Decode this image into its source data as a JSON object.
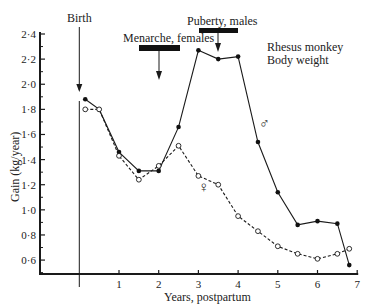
{
  "chart_data": {
    "type": "line",
    "title": "Rhesus monkey Body weight",
    "title_lines": [
      "Rhesus monkey",
      "Body weight"
    ],
    "xlabel": "Years, postpartum",
    "ylabel": "Gain (kg/year)",
    "xlim": [
      -1,
      7
    ],
    "ylim": [
      0.5,
      2.4
    ],
    "x_ticks": [
      1,
      2,
      3,
      4,
      5,
      6,
      7
    ],
    "x_tick_labels": [
      "1",
      "2",
      "3",
      "4",
      "5",
      "6",
      "7"
    ],
    "y_ticks": [
      0.6,
      0.8,
      1.0,
      1.2,
      1.4,
      1.6,
      1.8,
      2.0,
      2.2,
      2.4
    ],
    "y_tick_labels": [
      "0·6",
      "0·8",
      "1·0",
      "1·2",
      "1·4",
      "1·6",
      "1·8",
      "2·0",
      "2·2",
      "2·4"
    ],
    "grid": false,
    "series": [
      {
        "name": "Males",
        "symbol": "♂",
        "marker": "filled-circle",
        "line_style": "solid",
        "x": [
          0.15,
          0.5,
          1.0,
          1.5,
          2.0,
          2.5,
          3.0,
          3.5,
          4.0,
          4.5,
          5.0,
          5.5,
          6.0,
          6.5,
          6.8
        ],
        "values": [
          1.88,
          1.8,
          1.46,
          1.31,
          1.31,
          1.66,
          2.27,
          2.2,
          2.22,
          1.54,
          1.14,
          0.88,
          0.91,
          0.89,
          0.56
        ]
      },
      {
        "name": "Females",
        "symbol": "♀",
        "marker": "open-circle",
        "line_style": "dashed",
        "x": [
          0.15,
          0.5,
          1.0,
          1.5,
          2.0,
          2.5,
          3.0,
          3.5,
          4.0,
          4.5,
          5.0,
          5.5,
          6.0,
          6.5,
          6.8
        ],
        "values": [
          1.8,
          1.8,
          1.43,
          1.24,
          1.35,
          1.51,
          1.27,
          1.2,
          0.95,
          0.83,
          0.71,
          0.65,
          0.61,
          0.65,
          0.69
        ]
      }
    ],
    "annotations": [
      {
        "label": "Birth",
        "x": 0,
        "type": "vertical-line-arrow"
      },
      {
        "label": "Menarche, females",
        "x_range": [
          1.7,
          2.6
        ],
        "arrow_x": 2.0,
        "arrow_to_y": 2.05,
        "type": "bar-arrow"
      },
      {
        "label": "Puberty, males",
        "x_range": [
          3.0,
          4.0
        ],
        "arrow_x": 3.5,
        "arrow_to_y": 2.27,
        "type": "bar-arrow"
      }
    ],
    "legend_position": "inline labels (♂ near male curve, ♀ near female curve)"
  },
  "labels": {
    "birth": "Birth",
    "menarche": "Menarche, females",
    "puberty": "Puberty, males",
    "title_line1": "Rhesus monkey",
    "title_line2": "Body weight",
    "xlabel": "Years, postpartum",
    "ylabel": "Gain (kg/year)",
    "male_symbol": "♂",
    "female_symbol": "♀"
  }
}
